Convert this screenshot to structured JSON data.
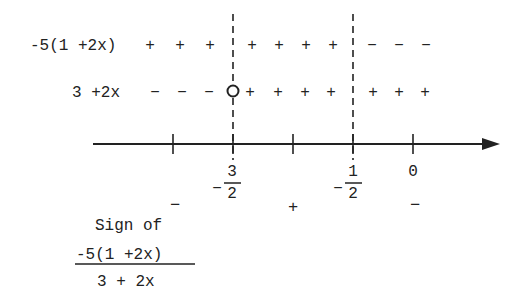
{
  "rows": [
    {
      "label": "-5(1 +2x)",
      "left_signs": [
        "+",
        "+",
        "+"
      ],
      "mid_signs": [
        "+",
        "+",
        "+",
        "+"
      ],
      "right_signs": [
        "−",
        "−",
        "−"
      ]
    },
    {
      "label": "3 +2x",
      "left_signs": [
        "−",
        "−",
        "−"
      ],
      "mid_signs": [
        "+",
        "+",
        "+",
        "+"
      ],
      "right_signs": [
        "+",
        "+",
        "+"
      ]
    }
  ],
  "axis": {
    "critical_points": [
      {
        "sign": "−",
        "num": "3",
        "den": "2"
      },
      {
        "sign": "−",
        "num": "1",
        "den": "2"
      }
    ],
    "zero_label": "0"
  },
  "result_signs": [
    "−",
    "+",
    "−"
  ],
  "caption": {
    "line1": "Sign of",
    "numerator": "-5(1 +2x)",
    "denominator": "3 + 2x"
  },
  "colors": {
    "ink": "#222222",
    "background": "#ffffff"
  }
}
